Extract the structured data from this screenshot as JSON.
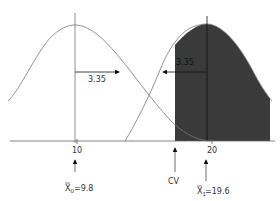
{
  "diagram": {
    "type": "hypothesis-test-power-diagram",
    "curves": [
      {
        "name": "null-distribution",
        "mean_label": "X̄0=9.8",
        "shaded": false
      },
      {
        "name": "alternative-distribution",
        "mean_label": "X̄1=19.6",
        "shaded": true
      }
    ],
    "axis": {
      "ticks": [
        {
          "value": "10",
          "x": 77
        },
        {
          "value": "20",
          "x": 212
        }
      ]
    },
    "arrows": [
      {
        "name": "left-distance-arrow",
        "label": "3.35",
        "direction": "right"
      },
      {
        "name": "right-distance-arrow",
        "label": "3.35",
        "direction": "left"
      }
    ],
    "markers": [
      {
        "name": "null-mean-marker",
        "label_main": "X",
        "label_sub": "0",
        "label_value": "=9.8"
      },
      {
        "name": "critical-value-marker",
        "label": "CV"
      },
      {
        "name": "alt-mean-marker",
        "label_main": "X",
        "label_sub": "1",
        "label_value": "=19.6"
      }
    ],
    "colors": {
      "shade": "#3a3a3a",
      "line": "#555555",
      "axis": "#666666",
      "background": "#ffffff"
    }
  }
}
